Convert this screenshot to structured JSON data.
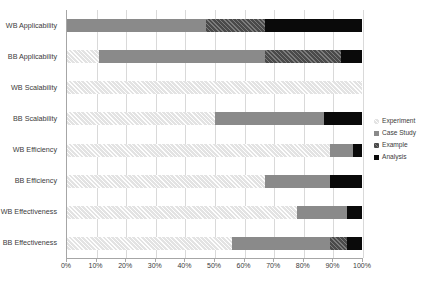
{
  "chart_data": {
    "type": "bar",
    "orientation": "horizontal",
    "stacked": true,
    "normalized_percent": true,
    "title": "",
    "subtitle": "",
    "xlabel": "",
    "ylabel": "",
    "xlim": [
      0,
      100
    ],
    "xtick_labels": [
      "0%",
      "10%",
      "20%",
      "30%",
      "40%",
      "50%",
      "60%",
      "70%",
      "80%",
      "90%",
      "100%"
    ],
    "xtick_values": [
      0,
      10,
      20,
      30,
      40,
      50,
      60,
      70,
      80,
      90,
      100
    ],
    "grid": "vertical",
    "legend_position": "right",
    "categories": [
      "WB Applicability",
      "BB Applicability",
      "WB Scalability",
      "BB Scalability",
      "WB Efficiency",
      "BB Efficiency",
      "WB Effectiveness",
      "BB Effectiveness"
    ],
    "series": [
      {
        "name": "Experiment",
        "color": "#e3e3e3",
        "values": [
          0,
          11,
          100,
          50,
          89,
          67,
          78,
          56
        ]
      },
      {
        "name": "Case Study",
        "color": "#8a8a8a",
        "values": [
          47,
          56,
          0,
          37,
          8,
          22,
          17,
          33
        ]
      },
      {
        "name": "Example",
        "color": "#4a4a4a",
        "values": [
          20,
          26,
          0,
          0,
          0,
          0,
          0,
          6
        ]
      },
      {
        "name": "Analysis",
        "color": "#0a0a0a",
        "values": [
          33,
          7,
          0,
          13,
          3,
          11,
          5,
          5
        ]
      }
    ]
  },
  "legend": {
    "items": [
      {
        "label": "Experiment",
        "swatch_class": "s-experiment"
      },
      {
        "label": "Case Study",
        "swatch_class": "s-casestudy"
      },
      {
        "label": "Example",
        "swatch_class": "s-example"
      },
      {
        "label": "Analysis",
        "swatch_class": "s-analysis"
      }
    ]
  },
  "colors": {
    "experiment": "#e3e3e3",
    "case_study": "#8a8a8a",
    "example": "#4a4a4a",
    "analysis": "#0a0a0a",
    "gridline": "#d9d9d9",
    "axis": "#a6a6a6",
    "text": "#3b3b3b",
    "background": "#ffffff"
  }
}
